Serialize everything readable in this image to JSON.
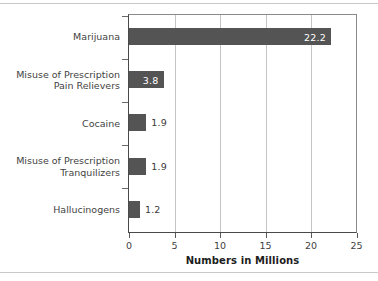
{
  "chart_data": {
    "type": "bar",
    "orientation": "horizontal",
    "title": "",
    "xlabel": "Numbers in Millions",
    "ylabel": "",
    "categories": [
      "Marijuana",
      "Misuse of Prescription\nPain Relievers",
      "Cocaine",
      "Misuse of Prescription\nTranquilizers",
      "Hallucinogens"
    ],
    "values": [
      22.2,
      3.8,
      1.9,
      1.9,
      1.2
    ],
    "value_labels": [
      "22.2",
      "3.8",
      "1.9",
      "1.9",
      "1.2"
    ],
    "label_position": [
      "inside",
      "inside",
      "outside",
      "outside",
      "outside"
    ],
    "xlim": [
      0,
      25
    ],
    "xticks": [
      0,
      5,
      10,
      15,
      20,
      25
    ],
    "xtick_labels": [
      "0",
      "5",
      "10",
      "15",
      "20",
      "25"
    ],
    "grid": "vertical",
    "legend": "none",
    "bar_color": "#545454",
    "gridline_color": "#c4c4c4",
    "axis_color": "#4a4a4a",
    "inside_label_color": "#ffffff",
    "outside_label_color": "#3a3a3a"
  }
}
